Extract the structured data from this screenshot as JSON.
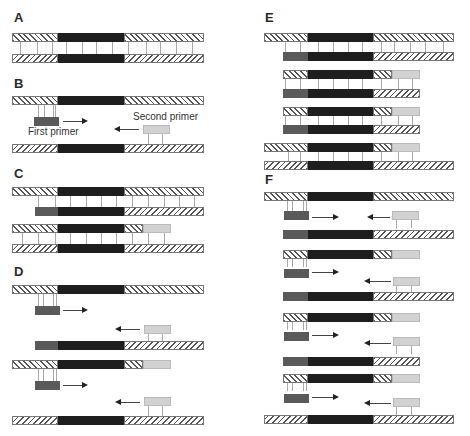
{
  "figure": {
    "panels": [
      {
        "id": "A",
        "label": "A"
      },
      {
        "id": "B",
        "label": "B"
      },
      {
        "id": "C",
        "label": "C"
      },
      {
        "id": "D",
        "label": "D"
      },
      {
        "id": "E",
        "label": "E"
      },
      {
        "id": "F",
        "label": "F"
      }
    ],
    "annotations": {
      "first_primer": "First primer",
      "second_primer": "Second primer"
    },
    "legend_semantics": {
      "black_segment": "target DNA region",
      "dark_gray_box": "first primer",
      "light_gray_box": "second primer",
      "hatched_segments": "flanking template DNA strands"
    },
    "colors": {
      "target": "#1e1e1e",
      "first_primer": "#5a5a5a",
      "second_primer": "#d2d2d2",
      "hatch": "#555555"
    }
  }
}
